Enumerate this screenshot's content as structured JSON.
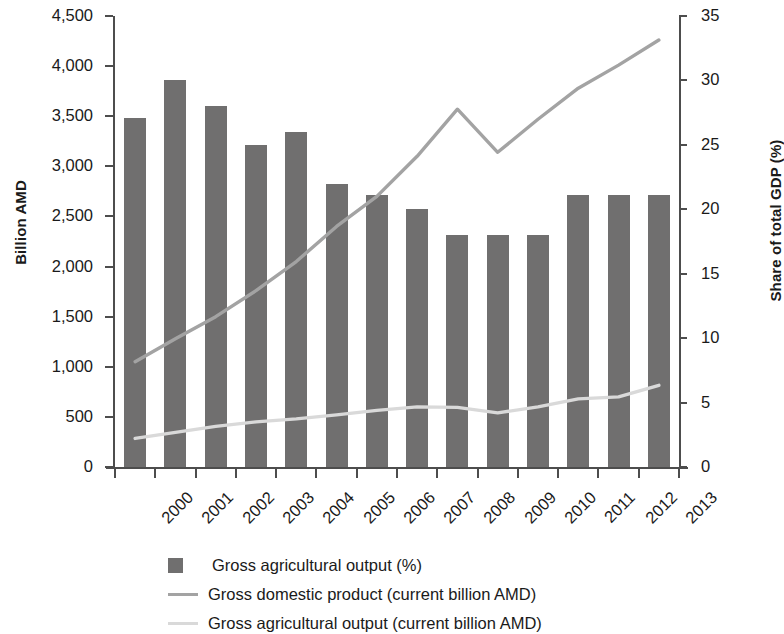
{
  "axes": {
    "y_left_title": "Billion AMD",
    "y_right_title": "Share of total GDP (%)",
    "y_left_ticks": [
      "0",
      "500",
      "1,000",
      "1,500",
      "2,000",
      "2,500",
      "3,000",
      "3,500",
      "4,000",
      "4,500"
    ],
    "y_right_ticks": [
      "0",
      "5",
      "10",
      "15",
      "20",
      "25",
      "30",
      "35"
    ],
    "x_ticks": [
      "2000",
      "2001",
      "2002",
      "2003",
      "2004",
      "2005",
      "2006",
      "2007",
      "2008",
      "2009",
      "2010",
      "2011",
      "2012",
      "2013"
    ]
  },
  "legend": {
    "items": [
      {
        "label": "Gross agricultural output (%)",
        "marker": "square-swatch",
        "color": "#706f6f"
      },
      {
        "label": "Gross domestic product (current billion AMD)",
        "marker": "line-swatch",
        "color": "#a3a3a3"
      },
      {
        "label": "Gross agricultural output (current billion AMD)",
        "marker": "line-swatch",
        "color": "#d9d9d9"
      }
    ]
  },
  "colors": {
    "bar": "#706f6f",
    "gdp_line": "#a3a3a3",
    "agriculture_line": "#d9d9d9",
    "axis": "#4d4d4d",
    "text": "#1a1a1a",
    "background": "#ffffff"
  },
  "chart_data": {
    "type": "bar",
    "title": "",
    "xlabel": "",
    "ylabel": "Billion AMD",
    "y2label": "Share of total GDP (%)",
    "ylim": [
      0,
      4500
    ],
    "y2lim": [
      0,
      35
    ],
    "yticks": [
      0,
      500,
      1000,
      1500,
      2000,
      2500,
      3000,
      3500,
      4000,
      4500
    ],
    "y2ticks": [
      0,
      5,
      10,
      15,
      20,
      25,
      30,
      35
    ],
    "grid": false,
    "legend_position": "bottom",
    "categories": [
      "2000",
      "2001",
      "2002",
      "2003",
      "2004",
      "2005",
      "2006",
      "2007",
      "2008",
      "2009",
      "2010",
      "2011",
      "2012",
      "2013"
    ],
    "series": [
      {
        "name": "Gross agricultural output (%)",
        "type": "bar",
        "axis": "right",
        "units": "%",
        "color": "#706f6f",
        "values": [
          27.1,
          30.0,
          28.0,
          25.0,
          26.0,
          22.0,
          21.1,
          20.0,
          18.0,
          18.0,
          18.0,
          21.1,
          21.1,
          21.1
        ]
      },
      {
        "name": "Gross domestic product (current billion AMD)",
        "type": "line",
        "axis": "left",
        "units": "billion AMD",
        "color": "#a3a3a3",
        "values": [
          1050,
          1280,
          1500,
          1760,
          2050,
          2400,
          2700,
          3100,
          3570,
          3140,
          3470,
          3780,
          4010,
          4260
        ]
      },
      {
        "name": "Gross agricultural output (current billion AMD)",
        "type": "line",
        "axis": "left",
        "units": "billion AMD",
        "color": "#d9d9d9",
        "values": [
          285,
          345,
          405,
          450,
          480,
          520,
          565,
          600,
          595,
          540,
          600,
          680,
          700,
          815
        ]
      }
    ]
  }
}
